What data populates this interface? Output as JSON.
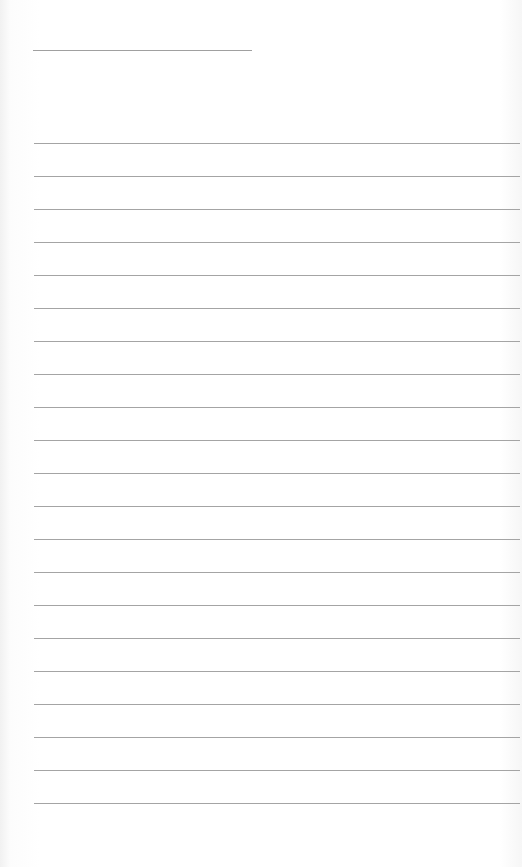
{
  "document": {
    "type": "lined-paper",
    "title_line": {
      "text": ""
    },
    "lines": [
      "",
      "",
      "",
      "",
      "",
      "",
      "",
      "",
      "",
      "",
      "",
      "",
      "",
      "",
      "",
      "",
      "",
      "",
      "",
      "",
      ""
    ],
    "rule_color": "#a4a4a4",
    "line_spacing_px": 33
  }
}
